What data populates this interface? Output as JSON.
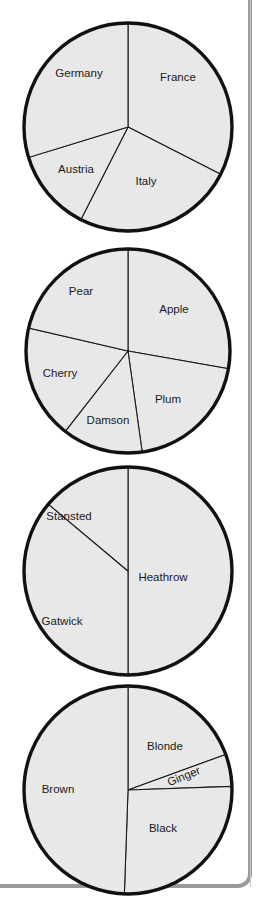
{
  "page": {
    "background_color": "#ffffff",
    "frame_color": "#9a9a9a",
    "wedge_fill": "#e8e8e8",
    "wedge_stroke": "#1a1a1a",
    "outline_color": "#111111",
    "label_color": "#1a1a1a"
  },
  "chart_data": [
    {
      "type": "pie",
      "name": "countries-pie",
      "title": "",
      "center": [
        128,
        127
      ],
      "radius": 104,
      "start_angle": 0,
      "categories": [
        "France",
        "Italy",
        "Austria",
        "Germany"
      ],
      "values": [
        32.5,
        25.0,
        12.8,
        29.7
      ],
      "angles_deg": [
        117,
        90,
        46,
        107
      ],
      "labels": [
        {
          "text": "France",
          "x": 178,
          "y": 78
        },
        {
          "text": "Italy",
          "x": 146,
          "y": 182
        },
        {
          "text": "Austria",
          "x": 76,
          "y": 170
        },
        {
          "text": "Germany",
          "x": 79,
          "y": 74
        }
      ]
    },
    {
      "type": "pie",
      "name": "fruit-pie",
      "title": "",
      "center": [
        128,
        351
      ],
      "radius": 102,
      "start_angle": 0,
      "categories": [
        "Apple",
        "Plum",
        "Damson",
        "Cherry",
        "Pear"
      ],
      "values": [
        27.8,
        20.0,
        12.8,
        18.1,
        21.4
      ],
      "angles_deg": [
        100,
        72,
        46,
        65,
        77
      ],
      "labels": [
        {
          "text": "Apple",
          "x": 174,
          "y": 310
        },
        {
          "text": "Plum",
          "x": 168,
          "y": 400
        },
        {
          "text": "Damson",
          "x": 108,
          "y": 421
        },
        {
          "text": "Cherry",
          "x": 60,
          "y": 374
        },
        {
          "text": "Pear",
          "x": 81,
          "y": 292
        }
      ]
    },
    {
      "type": "pie",
      "name": "airports-pie",
      "title": "",
      "center": [
        128,
        571
      ],
      "radius": 104,
      "start_angle": 0,
      "categories": [
        "Heathrow",
        "Gatwick",
        "Stansted"
      ],
      "values": [
        50.0,
        36.1,
        13.9
      ],
      "angles_deg": [
        180,
        130,
        50
      ],
      "labels": [
        {
          "text": "Heathrow",
          "x": 163,
          "y": 578
        },
        {
          "text": "Gatwick",
          "x": 62,
          "y": 622
        },
        {
          "text": "Stansted",
          "x": 69,
          "y": 517
        }
      ]
    },
    {
      "type": "pie",
      "name": "hair-colour-pie",
      "title": "",
      "center": [
        128,
        790
      ],
      "radius": 104,
      "start_angle": 0,
      "categories": [
        "Blonde",
        "Ginger",
        "Black",
        "Brown"
      ],
      "values": [
        19.4,
        5.0,
        26.1,
        49.5
      ],
      "angles_deg": [
        70,
        18,
        94,
        178
      ],
      "labels": [
        {
          "text": "Blonde",
          "x": 165,
          "y": 747
        },
        {
          "text": "Ginger",
          "x": 184,
          "y": 777,
          "rotate": -22
        },
        {
          "text": "Black",
          "x": 163,
          "y": 829
        },
        {
          "text": "Brown",
          "x": 58,
          "y": 790
        }
      ]
    }
  ]
}
